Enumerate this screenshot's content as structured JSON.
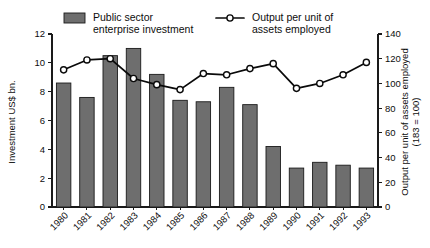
{
  "chart_data": {
    "type": "bar",
    "title": "",
    "subtitle": "",
    "xlabel": "",
    "ylabel": "Investment US$ bn.",
    "y2label": "Output per unit of assets employed",
    "y2label_note": "(183 = 100)",
    "categories": [
      "1980",
      "1981",
      "1982",
      "1983",
      "1984",
      "1985",
      "1986",
      "1987",
      "1988",
      "1989",
      "1990",
      "1991",
      "1992",
      "1993"
    ],
    "ylim": [
      0,
      12
    ],
    "y2lim": [
      0,
      140
    ],
    "yticks": [
      "0",
      "2",
      "4",
      "6",
      "8",
      "10",
      "12"
    ],
    "ytick_values": [
      0,
      2,
      4,
      6,
      8,
      10,
      12
    ],
    "y2ticks": [
      "0",
      "20",
      "40",
      "60",
      "80",
      "100",
      "120",
      "140"
    ],
    "y2tick_values": [
      0,
      20,
      40,
      60,
      80,
      100,
      120,
      140
    ],
    "grid": false,
    "legend_position": "top",
    "series": [
      {
        "name": "Public sector enterprise investment",
        "type": "bar",
        "axis": "left",
        "color": "#6e6e6e",
        "values": [
          8.6,
          7.6,
          10.5,
          11.0,
          9.2,
          7.4,
          7.3,
          8.3,
          7.1,
          4.2,
          2.7,
          3.1,
          2.9,
          2.7
        ]
      },
      {
        "name": "Output per unit of assets employed",
        "type": "line",
        "axis": "right",
        "color": "#0a0a0a",
        "values": [
          111,
          119,
          120,
          104,
          99,
          95,
          108,
          107,
          112,
          116,
          96,
          100,
          107,
          117
        ]
      }
    ]
  },
  "legend": {
    "bar_label_line1": "Public sector",
    "bar_label_line2": "enterprise investment",
    "line_label_line1": "Output per unit of",
    "line_label_line2": "assets employed"
  },
  "axes": {
    "left_title": "Investment US$ bn.",
    "right_title_line1": "Output per unit of assets employed",
    "right_title_line2": "(183 = 100)"
  }
}
